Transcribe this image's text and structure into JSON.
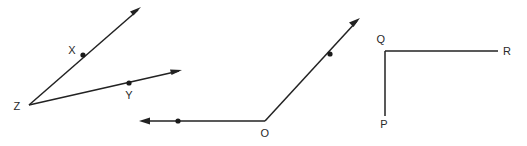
{
  "figure": {
    "width": 527,
    "height": 146,
    "background_color": "#ffffff",
    "stroke_color": "#222222",
    "label_color": "#2a2a2a"
  },
  "angles": [
    {
      "id": "angle-xzy",
      "name": "Angle XZY",
      "vertex_label": "Z",
      "vertex": {
        "x": 29,
        "y": 105
      },
      "vertex_label_pos": {
        "x": 17,
        "y": 110
      },
      "rays": [
        {
          "id": "ray-zx",
          "through_label": "X",
          "through_point": {
            "x": 83,
            "y": 55
          },
          "through_label_pos": {
            "x": 72,
            "y": 54
          },
          "tip": {
            "x": 141,
            "y": 7
          },
          "has_arrow": true,
          "has_dot": true
        },
        {
          "id": "ray-zy",
          "through_label": "Y",
          "through_point": {
            "x": 129,
            "y": 83
          },
          "through_label_pos": {
            "x": 129,
            "y": 99
          },
          "tip": {
            "x": 182,
            "y": 70
          },
          "has_arrow": true,
          "has_dot": true
        }
      ]
    },
    {
      "id": "angle-o",
      "name": "Angle O",
      "vertex_label": "O",
      "vertex": {
        "x": 265,
        "y": 121
      },
      "vertex_label_pos": {
        "x": 265,
        "y": 137
      },
      "rays": [
        {
          "id": "ray-o-left",
          "through_label": "",
          "through_point": {
            "x": 178,
            "y": 121
          },
          "through_label_pos": {
            "x": 178,
            "y": 137
          },
          "tip": {
            "x": 139,
            "y": 121
          },
          "has_arrow": true,
          "has_dot": true
        },
        {
          "id": "ray-o-upright",
          "through_label": "",
          "through_point": {
            "x": 330,
            "y": 54
          },
          "through_label_pos": {
            "x": 340,
            "y": 54
          },
          "tip": {
            "x": 360,
            "y": 18
          },
          "has_arrow": true,
          "has_dot": true
        }
      ]
    },
    {
      "id": "angle-pqr",
      "name": "Angle PQR",
      "vertex_label": "Q",
      "vertex": {
        "x": 385,
        "y": 51
      },
      "vertex_label_pos": {
        "x": 381,
        "y": 43
      },
      "rays": [
        {
          "id": "segment-qr",
          "through_label": "R",
          "through_point": null,
          "through_label_pos": {
            "x": 505,
            "y": 51
          },
          "tip": {
            "x": 498,
            "y": 51
          },
          "has_arrow": false,
          "has_dot": false
        },
        {
          "id": "segment-qp",
          "through_label": "P",
          "through_point": null,
          "through_label_pos": {
            "x": 384,
            "y": 128
          },
          "tip": {
            "x": 385,
            "y": 116
          },
          "has_arrow": false,
          "has_dot": false
        }
      ]
    }
  ],
  "labels": {
    "x": "X",
    "y": "Y",
    "z": "Z",
    "o": "O",
    "p": "P",
    "q": "Q",
    "r": "R"
  }
}
